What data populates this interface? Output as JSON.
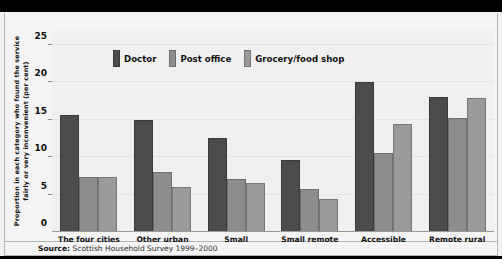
{
  "banner": {
    "text": ""
  },
  "source": {
    "prefix": "Source:",
    "text": "Scottish Household Survey 1999–2000"
  },
  "chart_data": {
    "type": "bar",
    "title": "",
    "xlabel": "",
    "ylabel": "Proportion in each category who found the service fairly or very inconvenient (per cent)",
    "ylim": [
      0,
      27
    ],
    "yticks": [
      5,
      10,
      15,
      20,
      25
    ],
    "ytick_labels": [
      "5",
      "10",
      "15",
      "20",
      "25"
    ],
    "grid": true,
    "legend_position": "top-left-inside",
    "categories": [
      "The four cities",
      "Other urban",
      "Small\naccessible",
      "Small remote",
      "Accessible\nrural",
      "Remote rural"
    ],
    "series": [
      {
        "name": "Doctor",
        "color": "#4c4c4c",
        "values": [
          15.7,
          15.0,
          12.6,
          9.6,
          20.1,
          18.0
        ]
      },
      {
        "name": "Post office",
        "color": "#8d8d8d",
        "values": [
          7.3,
          8.0,
          7.1,
          5.8,
          10.5,
          15.3
        ]
      },
      {
        "name": "Grocery/food shop",
        "color": "#9a9a9a",
        "values": [
          7.3,
          6.0,
          6.5,
          4.4,
          14.4,
          17.9
        ]
      }
    ]
  }
}
